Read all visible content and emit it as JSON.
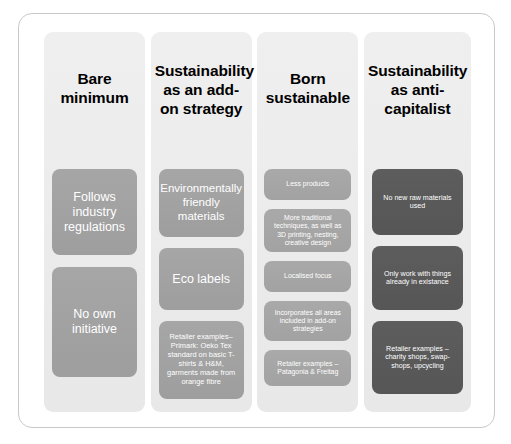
{
  "diagram": {
    "title_present": false,
    "colors": {
      "frame_border": "#c9c9c9",
      "column_background": "#ededed",
      "box_mid_gray": "#a0a0a0",
      "box_light_gray": "#a5a5a5",
      "box_dark_gray": "#595959",
      "header_text": "#000000",
      "box_text": "#ffffff"
    },
    "columns": [
      {
        "id": "bare-minimum",
        "header": "Bare minimum",
        "shade": "shade-mid",
        "boxes": [
          {
            "text": "Follows industry regulations"
          },
          {
            "text": "No own initiative"
          }
        ]
      },
      {
        "id": "add-on-strategy",
        "header": "Sustainability as an add-on strategy",
        "shade": "shade-mid",
        "boxes": [
          {
            "text": "Environmentally friendly materials"
          },
          {
            "text": "Eco labels"
          },
          {
            "text": "Retailer examples– Primark: Oeko Tex standard on basic T-shirts & H&M, garments made from orange fibre"
          }
        ]
      },
      {
        "id": "born-sustainable",
        "header": "Born sustainable",
        "shade": "shade-mid2",
        "boxes": [
          {
            "text": "Less products"
          },
          {
            "text": "More traditional techniques, as well as 3D printing, nesting, creative design"
          },
          {
            "text": "Localised focus"
          },
          {
            "text": "Incorporates all areas included in add-on strategies"
          },
          {
            "text": "Retailer examples – Patagonia & Freitag"
          }
        ]
      },
      {
        "id": "anti-capitalist",
        "header": "Sustainability as anti-capitalist",
        "shade": "shade-dark",
        "boxes": [
          {
            "text": "No new raw materials used"
          },
          {
            "text": "Only work with things already in existance"
          },
          {
            "text": "Retailer examples – charity shops, swap-shops, upcycling"
          }
        ]
      }
    ]
  }
}
